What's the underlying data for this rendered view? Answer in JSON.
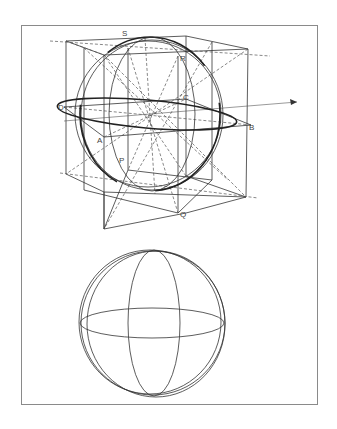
{
  "figure": {
    "top_diagram": {
      "description": "Sphere inscribed in a cube shown in perspective, with construction lines",
      "labels": {
        "S": "S",
        "R": "R",
        "D": "D",
        "B": "B",
        "A": "A",
        "P": "P",
        "Q": "Q",
        "C": "C"
      }
    },
    "bottom_diagram": {
      "description": "Wireframe sphere with equator and meridian ellipses"
    }
  },
  "colors": {
    "line": "#333333",
    "frame": "#8a8a8a",
    "background": "#ffffff"
  }
}
